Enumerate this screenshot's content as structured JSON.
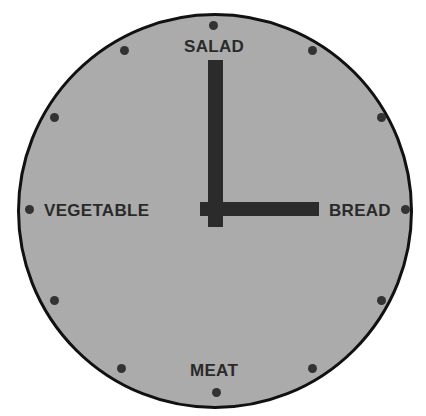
{
  "diagram": {
    "type": "clock-face",
    "labels": {
      "top": "SALAD",
      "right": "BREAD",
      "bottom": "MEAT",
      "left": "VEGETABLE"
    },
    "time_shown": "3:00",
    "colors": {
      "face": "#ababab",
      "rim": "#111111",
      "hands": "#2b2b2b",
      "markers": "#333333",
      "text": "#2a2a2a"
    },
    "hour_markers": 12
  }
}
